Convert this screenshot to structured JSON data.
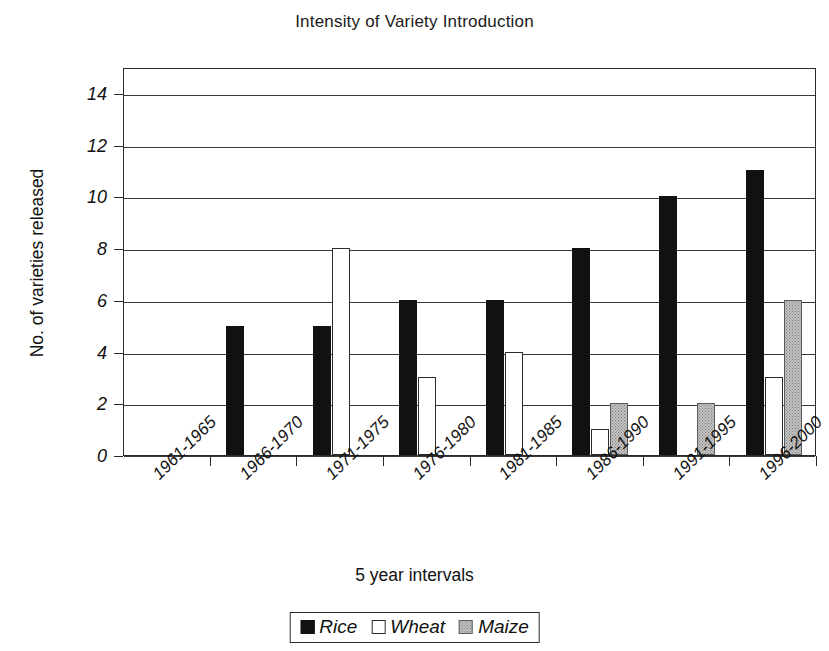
{
  "chart_data": {
    "type": "bar",
    "title": "Intensity of Variety Introduction",
    "xlabel": "5 year intervals",
    "ylabel": "No. of varieties released",
    "categories": [
      "1961-1965",
      "1966-1970",
      "1971-1975",
      "1976-1980",
      "1981-1985",
      "1986-1990",
      "1991-1995",
      "1996-2000"
    ],
    "series": [
      {
        "name": "Rice",
        "values": [
          0,
          5,
          5,
          6,
          6,
          8,
          10,
          11
        ],
        "color": "#111111"
      },
      {
        "name": "Wheat",
        "values": [
          0,
          0,
          8,
          3,
          4,
          1,
          0,
          3
        ],
        "color": "#ffffff"
      },
      {
        "name": "Maize",
        "values": [
          0,
          0,
          0,
          0,
          0,
          2,
          2,
          6
        ],
        "color": "#c2c2c2"
      }
    ],
    "ylim": [
      0,
      15
    ],
    "yticks": [
      0,
      2,
      4,
      6,
      8,
      10,
      12,
      14
    ],
    "ytick_labels": [
      "0",
      "2",
      "4",
      "6",
      "8",
      "10",
      "12",
      "14"
    ],
    "grid": true,
    "legend_position": "bottom-center"
  }
}
